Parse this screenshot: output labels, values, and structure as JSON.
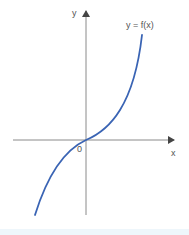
{
  "diagram": {
    "type": "function-graph",
    "axis_labels": {
      "x": "x",
      "y": "y"
    },
    "origin_label": "0",
    "curve_label": "y = f(x)",
    "curve_shape": "cubic-like, increasing, inflection at origin",
    "colors": {
      "curve": "#3a64b4",
      "axis": "#8a8a8a",
      "label": "#555555",
      "band": "#eef6fb"
    }
  }
}
